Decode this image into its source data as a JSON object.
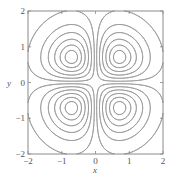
{
  "chart_data": {
    "type": "contour",
    "title": "",
    "xlabel": "x",
    "ylabel": "y",
    "xlim": [
      -2,
      2
    ],
    "ylim": [
      -2,
      2
    ],
    "xticks": [
      -2,
      -1,
      0,
      1,
      2
    ],
    "yticks": [
      -2,
      -1,
      0,
      1,
      2
    ],
    "xtick_labels": [
      "−2",
      "−1",
      "0",
      "1",
      "2"
    ],
    "ytick_labels": [
      "−2",
      "−1",
      "0",
      "1",
      "2"
    ],
    "function": "abs(x*y*exp(-(x^2+y^2)))",
    "levels": [
      0.015,
      0.05,
      0.085,
      0.12,
      0.15,
      0.172
    ],
    "lobe_centers": [
      [
        -0.71,
        0.71
      ],
      [
        0.71,
        0.71
      ],
      [
        -0.71,
        -0.71
      ],
      [
        0.71,
        -0.71
      ]
    ],
    "grid": false,
    "legend": null,
    "line_color": "#9a9a9a",
    "frame_color": "#8a8a8a"
  }
}
